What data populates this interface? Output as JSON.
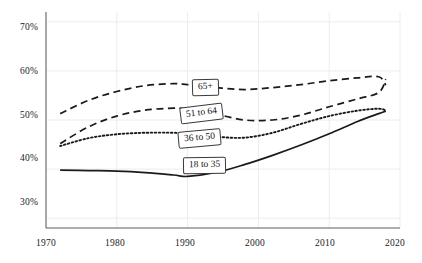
{
  "chart_data": {
    "type": "line",
    "title": "",
    "subtitle": "",
    "xlabel": "",
    "ylabel": "",
    "xlim": [
      1970,
      2020
    ],
    "ylim": [
      0.28,
      0.72
    ],
    "grid": true,
    "legend_position": "inline-labels",
    "y_tick_labels": [
      "70%",
      "60%",
      "50%",
      "40%",
      "30%"
    ],
    "y_tick_values": [
      0.7,
      0.6,
      0.5,
      0.4,
      0.3
    ],
    "x_tick_labels": [
      "1970",
      "1980",
      "1990",
      "2000",
      "2010",
      "2020"
    ],
    "x_tick_values": [
      1970,
      1980,
      1990,
      2000,
      2010,
      2020
    ],
    "series": [
      {
        "name": "65+",
        "style": "dashed",
        "color": "#1a1a1a",
        "x": [
          1972,
          1976,
          1980,
          1984,
          1988,
          1990,
          1994,
          1998,
          2002,
          2006,
          2010,
          2014,
          2017,
          2018
        ],
        "values": [
          0.513,
          0.54,
          0.558,
          0.57,
          0.574,
          0.572,
          0.566,
          0.562,
          0.566,
          0.572,
          0.58,
          0.586,
          0.588,
          0.571
        ]
      },
      {
        "name": "51 to 64",
        "style": "dashed",
        "color": "#1a1a1a",
        "x": [
          1972,
          1976,
          1980,
          1984,
          1988,
          1990,
          1994,
          1998,
          2002,
          2006,
          2010,
          2014,
          2017,
          2018
        ],
        "values": [
          0.452,
          0.486,
          0.508,
          0.52,
          0.524,
          0.522,
          0.512,
          0.5,
          0.5,
          0.51,
          0.527,
          0.543,
          0.556,
          0.583
        ]
      },
      {
        "name": "36 to 50",
        "style": "dotted",
        "color": "#1a1a1a",
        "x": [
          1972,
          1976,
          1980,
          1984,
          1988,
          1990,
          1994,
          1998,
          2002,
          2006,
          2010,
          2014,
          2017,
          2018
        ],
        "values": [
          0.447,
          0.463,
          0.471,
          0.474,
          0.474,
          0.472,
          0.466,
          0.464,
          0.474,
          0.492,
          0.508,
          0.519,
          0.523,
          0.519
        ]
      },
      {
        "name": "18 to 35",
        "style": "solid",
        "color": "#1a1a1a",
        "x": [
          1972,
          1976,
          1980,
          1984,
          1988,
          1990,
          1994,
          1998,
          2002,
          2006,
          2010,
          2014,
          2017,
          2018
        ],
        "values": [
          0.398,
          0.397,
          0.396,
          0.393,
          0.388,
          0.385,
          0.393,
          0.409,
          0.428,
          0.449,
          0.472,
          0.497,
          0.513,
          0.518
        ]
      }
    ]
  },
  "axes": {
    "y_labels": [
      "70%",
      "60%",
      "50%",
      "40%",
      "30%"
    ],
    "x_labels": [
      "1970",
      "1980",
      "1990",
      "2000",
      "2010",
      "2020"
    ]
  },
  "labels": {
    "s65plus": "65+",
    "s51to64": "51 to 64",
    "s36to50": "36 to 50",
    "s18to35": "18 to 35"
  },
  "colors": {
    "line": "#1a1a1a",
    "grid": "#ececec",
    "axis": "#4a4a4a",
    "text": "#1a1a1a",
    "background": "#ffffff"
  }
}
